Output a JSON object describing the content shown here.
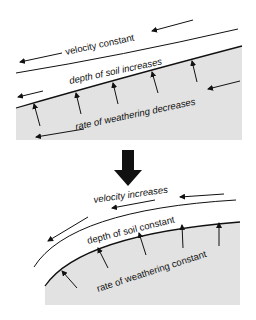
{
  "colors": {
    "bedrock": "#e2e2e2",
    "line": "#111111",
    "background": "#ffffff"
  },
  "top_panel": {
    "velocity_label": "velocity constant",
    "soil_label": "depth of soil increases",
    "weathering_label": "rate of weathering decreases"
  },
  "transition_arrow": "down-arrow",
  "bottom_panel": {
    "velocity_label": "velocity increases",
    "soil_label": "depth of soil constant",
    "weathering_label": "rate of weathering constant"
  }
}
